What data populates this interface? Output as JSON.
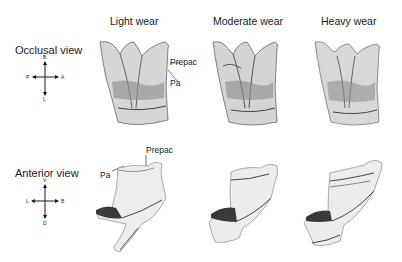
{
  "columns": [
    {
      "label": "Light wear"
    },
    {
      "label": "Moderate wear"
    },
    {
      "label": "Heavy wear"
    }
  ],
  "rows": [
    {
      "label": "Occlusal view",
      "compass": {
        "top": "B",
        "bottom": "L",
        "left": "P",
        "right": "A"
      },
      "annotations": {
        "prepac": "Prepac",
        "pa": "Pa"
      }
    },
    {
      "label": "Anterior view",
      "compass": {
        "top": "V",
        "bottom": "D",
        "left": "L",
        "right": "B"
      },
      "annotations": {
        "prepac": "Prepac",
        "pa": "Pa"
      }
    }
  ],
  "colors": {
    "ink": "#1a1a1a",
    "shade": "#5a5a5a",
    "light": "#bdbdbd",
    "dark": "#2a2a2a"
  }
}
